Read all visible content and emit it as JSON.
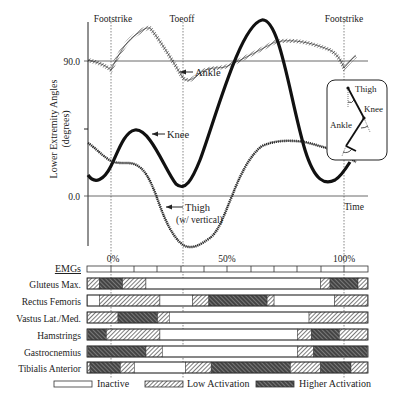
{
  "figure": {
    "event_labels": {
      "footstrike_start": "Footstrike",
      "toeoff": "Toeoff",
      "footstrike_end": "Footstrike"
    },
    "y_axis": {
      "label_line1": "Lower Extremity Angles",
      "label_line2": "(degrees)",
      "tick_90": "90.0",
      "tick_0": "0.0"
    },
    "x_axis": {
      "time_label": "Time",
      "tick_0": "0%",
      "tick_50": "50%",
      "tick_100": "100%"
    },
    "curve_labels": {
      "ankle": "Ankle",
      "knee": "Knee",
      "thigh_line1": "Thigh",
      "thigh_line2": "(w/ vertical)"
    },
    "inset": {
      "thigh": "Thigh",
      "knee": "Knee",
      "ankle": "Ankle"
    },
    "emg": {
      "header": "EMGs",
      "muscles": [
        "Gluteus Max.",
        "Rectus Femoris",
        "Vastus Lat./Med.",
        "Hamstrings",
        "Gastrocnemius",
        "Tibialis Anterior"
      ]
    },
    "legend": {
      "inactive": "Inactive",
      "low": "Low Activation",
      "high": "Higher Activation"
    },
    "colors": {
      "line": "#222222",
      "grid": "#555555",
      "dark_fill": "#333333"
    }
  },
  "chart_data": {
    "type": "line",
    "title": "",
    "xlabel": "Time (% gait cycle)",
    "ylabel": "Lower Extremity Angles (degrees)",
    "events": [
      {
        "label": "Footstrike",
        "x": 0
      },
      {
        "label": "Toeoff",
        "x": 31
      },
      {
        "label": "Footstrike",
        "x": 100
      }
    ],
    "x": [
      -10,
      0,
      10,
      20,
      31,
      40,
      50,
      60,
      70,
      80,
      90,
      100,
      105
    ],
    "series": [
      {
        "name": "Ankle",
        "values": [
          92,
          86,
          108,
          118,
          72,
          62,
          72,
          85,
          90,
          94,
          92,
          84,
          92
        ]
      },
      {
        "name": "Knee",
        "values": [
          16,
          22,
          52,
          40,
          8,
          28,
          65,
          98,
          88,
          35,
          8,
          18,
          30
        ]
      },
      {
        "name": "Thigh (w/ vertical)",
        "values": [
          38,
          33,
          30,
          24,
          -16,
          -40,
          -34,
          -6,
          30,
          40,
          38,
          30,
          28
        ]
      }
    ],
    "ylim": [
      -45,
      120
    ],
    "yticks": [
      0,
      45,
      90
    ],
    "emg_activation": {
      "levels": [
        "inactive",
        "low",
        "high"
      ],
      "muscles": [
        {
          "name": "Gluteus Max.",
          "segments": [
            [
              -10,
              -5,
              "low"
            ],
            [
              -5,
              5,
              "high"
            ],
            [
              5,
              15,
              "low"
            ],
            [
              15,
              90,
              "inactive"
            ],
            [
              90,
              94,
              "low"
            ],
            [
              94,
              106,
              "high"
            ],
            [
              106,
              110,
              "low"
            ]
          ]
        },
        {
          "name": "Rectus Femoris",
          "segments": [
            [
              -10,
              -5,
              "inactive"
            ],
            [
              -5,
              21,
              "low"
            ],
            [
              21,
              35,
              "inactive"
            ],
            [
              35,
              42,
              "low"
            ],
            [
              42,
              67,
              "high"
            ],
            [
              67,
              70,
              "low"
            ],
            [
              70,
              96,
              "inactive"
            ],
            [
              96,
              110,
              "low"
            ]
          ]
        },
        {
          "name": "Vastus Lat./Med.",
          "segments": [
            [
              -10,
              3,
              "low"
            ],
            [
              3,
              20,
              "high"
            ],
            [
              20,
              25,
              "low"
            ],
            [
              25,
              85,
              "inactive"
            ],
            [
              85,
              110,
              "low"
            ]
          ]
        },
        {
          "name": "Hamstrings",
          "segments": [
            [
              -10,
              -2,
              "high"
            ],
            [
              -2,
              21,
              "low"
            ],
            [
              21,
              80,
              "inactive"
            ],
            [
              80,
              86,
              "low"
            ],
            [
              86,
              98,
              "high"
            ],
            [
              98,
              110,
              "low"
            ]
          ]
        },
        {
          "name": "Gastrocnemius",
          "segments": [
            [
              -10,
              15,
              "high"
            ],
            [
              15,
              22,
              "low"
            ],
            [
              22,
              80,
              "inactive"
            ],
            [
              80,
              87,
              "low"
            ],
            [
              87,
              110,
              "high"
            ]
          ]
        },
        {
          "name": "Tibialis Anterior",
          "segments": [
            [
              -10,
              -9,
              "low"
            ],
            [
              -9,
              4,
              "high"
            ],
            [
              4,
              10,
              "low"
            ],
            [
              10,
              32,
              "inactive"
            ],
            [
              32,
              43,
              "low"
            ],
            [
              43,
              77,
              "high"
            ],
            [
              77,
              90,
              "low"
            ],
            [
              90,
              103,
              "high"
            ],
            [
              103,
              110,
              "low"
            ]
          ]
        }
      ]
    },
    "legend": [
      "Inactive",
      "Low Activation",
      "Higher Activation"
    ]
  }
}
